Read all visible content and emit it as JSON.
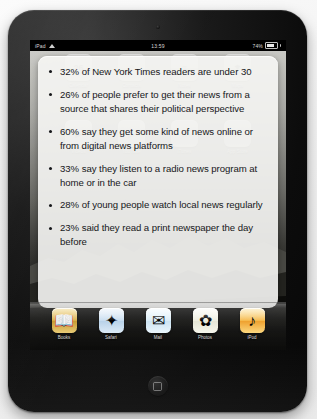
{
  "device": {
    "name": "ipad",
    "statusbar": {
      "carrier_label": "iPad",
      "wifi_icon": "wifi-icon",
      "time": "13:59",
      "battery_percent": "74%",
      "battery_icon": "battery-icon"
    },
    "home_button": "home-button",
    "camera": "front-camera"
  },
  "note_panel": {
    "bullets": [
      "32% of New York Times readers are under 30",
      "26% of people prefer to get their news from a source that shares their political perspective",
      "60% say they get some kind of news online or from digital news platforms",
      "33% say they listen to a radio news program at home or in the car",
      "28% of young people watch local news regularly",
      "23% said they read a print newspaper the day before"
    ]
  },
  "home_screen": {
    "apps": [
      {
        "label": "Calendar",
        "glyph": "26"
      },
      {
        "label": "Contacts",
        "glyph": "☺"
      },
      {
        "label": "Notes",
        "glyph": "≡"
      },
      {
        "label": "Maps",
        "glyph": "⌖"
      },
      {
        "label": "Videos",
        "glyph": "▶"
      },
      {
        "label": "YouTube",
        "glyph": "▷"
      },
      {
        "label": "iTunes",
        "glyph": "♫"
      },
      {
        "label": "App Store",
        "glyph": "A"
      }
    ],
    "page_dots": {
      "count": 3,
      "active_index": 1
    }
  },
  "dock": {
    "items": [
      {
        "label": "Books",
        "icon": "books-icon",
        "glyph": "📖",
        "color": "#d8ae48"
      },
      {
        "label": "Safari",
        "icon": "safari-icon",
        "glyph": "✦",
        "color": "#c7dcef"
      },
      {
        "label": "Mail",
        "icon": "mail-icon",
        "glyph": "✉",
        "color": "#d9ecf7"
      },
      {
        "label": "Photos",
        "icon": "photos-icon",
        "glyph": "✿",
        "color": "#ededdf"
      },
      {
        "label": "iPod",
        "icon": "ipod-icon",
        "glyph": "♪",
        "color": "#f5b94c"
      }
    ]
  },
  "colors": {
    "bezel": "#0c0c0c",
    "panel": "#f6f6f4",
    "text": "#16171a",
    "page_background": "#f4f4f4"
  }
}
